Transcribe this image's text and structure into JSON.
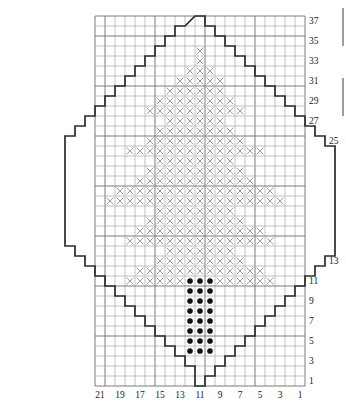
{
  "chart_data": {
    "type": "heatmap",
    "title": "",
    "xlabel": "",
    "ylabel": "",
    "grid": {
      "columns": 21,
      "rows": 37,
      "cell_size_px": 10,
      "origin_x_px": 95,
      "origin_y_px": 16,
      "column_order": "right-to-left",
      "row_order": "bottom-to-top",
      "grid_on": true,
      "major_every": 5
    },
    "axes": {
      "x_tick_labels": [
        "21",
        "19",
        "17",
        "15",
        "13",
        "11",
        "9",
        "7",
        "5",
        "3",
        "1"
      ],
      "x_tick_columns": [
        21,
        19,
        17,
        15,
        13,
        11,
        9,
        7,
        5,
        3,
        1
      ],
      "y_tick_labels": [
        "37",
        "35",
        "33",
        "31",
        "29",
        "27",
        "25",
        "13",
        "11",
        "9",
        "7",
        "5",
        "3",
        "1"
      ],
      "y_tick_rows": [
        37,
        35,
        33,
        31,
        29,
        27,
        25,
        13,
        11,
        9,
        7,
        5,
        3,
        1
      ],
      "xlim": [
        1,
        21
      ],
      "ylim": [
        1,
        37
      ]
    },
    "legend": {
      "symbols": [
        {
          "name": "x-stitch",
          "glyph": "×",
          "label": ""
        },
        {
          "name": "dot-stitch",
          "glyph": "●",
          "label": ""
        }
      ]
    },
    "x_cells": {
      "note": "rows keyed by chart row number (1=bottom); values are column numbers (1=rightmost)",
      "37": [],
      "36": [],
      "35": [],
      "34": [
        11
      ],
      "33": [
        11
      ],
      "32": [
        10,
        11,
        12
      ],
      "31": [
        9,
        10,
        11,
        12,
        13
      ],
      "30": [
        9,
        10,
        11,
        12,
        13,
        14
      ],
      "29": [
        8,
        9,
        10,
        11,
        12,
        13,
        14,
        15
      ],
      "28": [
        7,
        8,
        9,
        10,
        11,
        12,
        13,
        14,
        15,
        16
      ],
      "27": [
        9,
        10,
        11,
        12,
        13,
        14
      ],
      "26": [
        8,
        9,
        10,
        11,
        12,
        13,
        14,
        15
      ],
      "25": [
        7,
        8,
        9,
        10,
        11,
        12,
        13,
        14,
        15,
        16
      ],
      "24": [
        5,
        6,
        7,
        8,
        9,
        10,
        11,
        12,
        13,
        14,
        15,
        16,
        17,
        18
      ],
      "23": [
        8,
        9,
        10,
        11,
        12,
        13,
        14,
        15
      ],
      "22": [
        7,
        8,
        9,
        10,
        11,
        12,
        13,
        14,
        15,
        16
      ],
      "21": [
        6,
        7,
        8,
        9,
        10,
        11,
        12,
        13,
        14,
        15,
        16,
        17
      ],
      "20": [
        4,
        5,
        6,
        7,
        8,
        9,
        10,
        11,
        12,
        13,
        14,
        15,
        16,
        17,
        18,
        19
      ],
      "19": [
        3,
        4,
        5,
        6,
        7,
        8,
        9,
        10,
        11,
        12,
        13,
        14,
        15,
        16,
        17,
        18,
        19,
        20
      ],
      "18": [
        8,
        9,
        10,
        11,
        12,
        13,
        14,
        15
      ],
      "17": [
        7,
        8,
        9,
        10,
        11,
        12,
        13,
        14,
        15,
        16
      ],
      "16": [
        5,
        6,
        7,
        8,
        9,
        10,
        11,
        12,
        13,
        14,
        15,
        16,
        17
      ],
      "15": [
        4,
        5,
        6,
        7,
        8,
        9,
        10,
        11,
        12,
        13,
        14,
        15,
        16,
        17,
        18
      ],
      "14": [
        8,
        9,
        10,
        11,
        12,
        13,
        14
      ],
      "13": [
        7,
        8,
        9,
        10,
        11,
        12,
        13,
        14,
        15
      ],
      "12": [
        5,
        6,
        7,
        8,
        9,
        10,
        11,
        12,
        13,
        14,
        15,
        16,
        17
      ],
      "11": [
        4,
        5,
        6,
        7,
        8,
        9,
        13,
        14,
        15,
        16,
        17,
        18
      ],
      "10": [],
      "9": [],
      "8": [],
      "7": [],
      "6": [],
      "5": [],
      "4": [],
      "3": [],
      "2": [],
      "1": []
    },
    "dot_cells": {
      "note": "rows keyed by chart row number; values are column numbers",
      "11": [
        10,
        11,
        12
      ],
      "10": [
        10,
        11,
        12
      ],
      "9": [
        10,
        11,
        12
      ],
      "8": [
        10,
        11,
        12
      ],
      "7": [
        10,
        11,
        12
      ],
      "6": [
        10,
        11,
        12
      ],
      "5": [
        10,
        11,
        12
      ],
      "4": [
        10,
        11,
        12
      ]
    },
    "outline": {
      "note": "diamond motif boundary, stair-stepped, traced as polyline in px",
      "visible": true,
      "color": "#2b2b2b"
    }
  }
}
